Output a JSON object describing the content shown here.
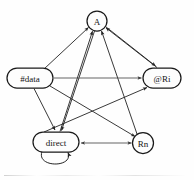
{
  "diagram": {
    "type": "directed-graph",
    "title": "",
    "background_color": "#fefefe",
    "stroke_color": "#232323",
    "node_fill_color": "#fdfdfd",
    "nodes": [
      {
        "id": "A",
        "label": "A",
        "shape": "circle",
        "cx": 97,
        "cy": 21,
        "rx": 10,
        "ry": 10
      },
      {
        "id": "data",
        "label": "#data",
        "shape": "stadium",
        "cx": 30,
        "cy": 78,
        "rx": 23,
        "ry": 10
      },
      {
        "id": "Ri",
        "label": "@Ri",
        "shape": "stadium",
        "cx": 162,
        "cy": 78,
        "rx": 19,
        "ry": 10
      },
      {
        "id": "direct",
        "label": "direct",
        "shape": "stadium",
        "cx": 56,
        "cy": 142,
        "rx": 23,
        "ry": 10
      },
      {
        "id": "Rn",
        "label": "Rn",
        "shape": "circle",
        "cx": 143,
        "cy": 143,
        "rx": 10.5,
        "ry": 10.5
      }
    ],
    "edges": [
      {
        "from": "data",
        "to": "A",
        "arrow": "forward"
      },
      {
        "from": "direct",
        "to": "A",
        "arrow": "forward"
      },
      {
        "from": "Rn",
        "to": "A",
        "arrow": "forward"
      },
      {
        "from": "Ri",
        "to": "A",
        "arrow": "forward"
      },
      {
        "from": "A",
        "to": "Ri",
        "arrow": "forward"
      },
      {
        "from": "A",
        "to": "direct",
        "arrow": "forward"
      },
      {
        "from": "data",
        "to": "Ri",
        "arrow": "forward"
      },
      {
        "from": "data",
        "to": "direct",
        "arrow": "forward"
      },
      {
        "from": "data",
        "to": "Rn",
        "arrow": "forward"
      },
      {
        "from": "direct",
        "to": "Ri",
        "arrow": "forward"
      },
      {
        "from": "direct",
        "to": "Rn",
        "arrow": "both"
      },
      {
        "from": "direct",
        "to": "direct",
        "arrow": "forward",
        "self_loop": true
      }
    ]
  }
}
